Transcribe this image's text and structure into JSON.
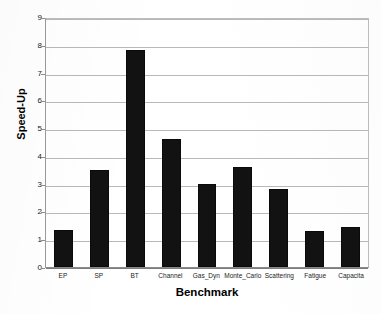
{
  "chart_data": {
    "type": "bar",
    "title": "",
    "xlabel": "Benchmark",
    "ylabel": "Speed-Up",
    "categories": [
      "EP",
      "SP",
      "BT",
      "Channel",
      "Gas_Dyn",
      "Monte_Carlo",
      "Scattering",
      "Fatigue",
      "Capacita"
    ],
    "values": [
      1.35,
      3.5,
      7.8,
      4.6,
      3.0,
      3.6,
      2.8,
      1.3,
      1.45
    ],
    "ylim": [
      0,
      9
    ],
    "ytick_labels": [
      "0",
      "1",
      "2",
      "3",
      "4",
      "5",
      "6",
      "7",
      "8",
      "9"
    ],
    "ytick_values": [
      0,
      1,
      2,
      3,
      4,
      5,
      6,
      7,
      8,
      9
    ],
    "grid": true,
    "legend": "none",
    "bar_color": "#121212",
    "grid_color": "#b9b9b9",
    "background": "#ffffff"
  }
}
